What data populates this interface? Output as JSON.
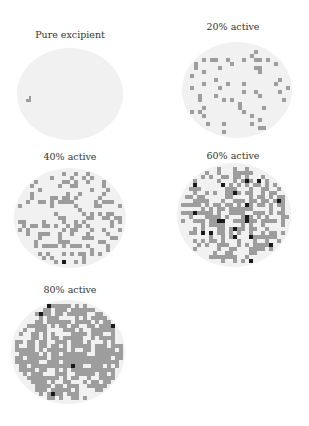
{
  "figure": {
    "colors": {
      "background": "#ffffff",
      "tablet": "#f1f1f1",
      "active": "#9d9d9d",
      "dense": "#1a1a1a"
    },
    "panels": [
      {
        "label": "Pure excipient",
        "active_fraction": 0.0,
        "dark_fraction": 0.0,
        "seed": 11,
        "label_x": 70,
        "label_y": 29,
        "cx": 70,
        "cy": 94,
        "rx": 53,
        "ry": 46
      },
      {
        "label": "20% active",
        "active_fraction": 0.2,
        "dark_fraction": 0.0,
        "seed": 23,
        "label_x": 233,
        "label_y": 21,
        "cx": 237,
        "cy": 90,
        "rx": 55,
        "ry": 48
      },
      {
        "label": "40% active",
        "active_fraction": 0.4,
        "dark_fraction": 0.01,
        "seed": 37,
        "label_x": 70,
        "label_y": 151,
        "cx": 70,
        "cy": 218,
        "rx": 56,
        "ry": 50
      },
      {
        "label": "60% active",
        "active_fraction": 0.6,
        "dark_fraction": 0.1,
        "seed": 53,
        "label_x": 233,
        "label_y": 150,
        "cx": 234,
        "cy": 215,
        "rx": 57,
        "ry": 52
      },
      {
        "label": "80% active",
        "active_fraction": 0.8,
        "dark_fraction": 0.02,
        "seed": 71,
        "label_x": 70,
        "label_y": 284,
        "cx": 68,
        "cy": 352,
        "rx": 57,
        "ry": 52
      }
    ]
  }
}
